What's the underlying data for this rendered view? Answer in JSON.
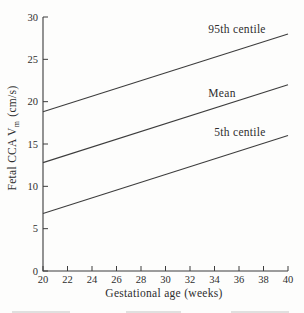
{
  "chart_data": {
    "type": "line",
    "title": "",
    "xlabel": "Gestational age (weeks)",
    "ylabel": "Fetal CCA Vm (cm/s)",
    "ylabel_parts": {
      "pre": "Fetal CCA V",
      "sub": "m",
      "post": " (cm/s)"
    },
    "xlim": [
      20,
      40
    ],
    "ylim": [
      0,
      30
    ],
    "x_ticks": [
      20,
      22,
      24,
      26,
      28,
      30,
      32,
      34,
      36,
      38,
      40
    ],
    "y_ticks": [
      0,
      5,
      10,
      15,
      20,
      25,
      30
    ],
    "x": [
      20,
      40
    ],
    "series": [
      {
        "name": "95th centile",
        "values": [
          18.8,
          28.0
        ]
      },
      {
        "name": "Mean",
        "values": [
          12.8,
          22.0
        ]
      },
      {
        "name": "5th centile",
        "values": [
          6.8,
          16.0
        ]
      }
    ],
    "grid": false,
    "legend_position": "inline-labels-above-lines",
    "line_color": "#3d3d3d",
    "text_color": "#2e2e2e",
    "background": "#fdfdfc"
  },
  "annotations": [
    {
      "text": "95th centile",
      "x_px": 237,
      "y_px": 29
    },
    {
      "text": "Mean",
      "x_px": 222,
      "y_px": 93
    },
    {
      "text": "5th centile",
      "x_px": 240,
      "y_px": 132
    }
  ]
}
